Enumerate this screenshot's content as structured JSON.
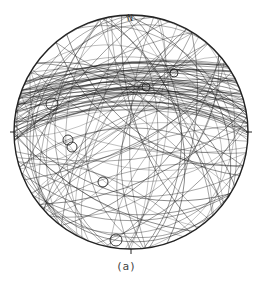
{
  "figure": {
    "caption": "(a)",
    "north_label": "N",
    "type": "equal-area stereonet (great circles)",
    "net": {
      "cx": 131,
      "cy": 132,
      "r": 117
    },
    "line_color": "#1a1a1a",
    "pole_markers": [
      {
        "x": 52,
        "y": 104,
        "r": 6
      },
      {
        "x": 68,
        "y": 140,
        "r": 5
      },
      {
        "x": 72,
        "y": 147,
        "r": 5
      },
      {
        "x": 103,
        "y": 182,
        "r": 5
      },
      {
        "x": 116,
        "y": 240,
        "r": 6
      },
      {
        "x": 146,
        "y": 87,
        "r": 4
      },
      {
        "x": 174,
        "y": 73,
        "r": 4
      }
    ]
  }
}
